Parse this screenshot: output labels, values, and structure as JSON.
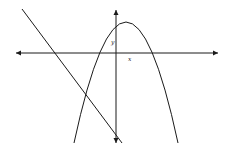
{
  "diagram": {
    "type": "coordinate-graph",
    "axes": {
      "x_label": "x",
      "y_label": "y",
      "x_axis": {
        "from": [
          16,
          53
        ],
        "to": [
          218,
          53
        ],
        "arrows": "both"
      },
      "y_axis": {
        "from": [
          116,
          10
        ],
        "to": [
          116,
          143
        ],
        "arrows": "both"
      }
    },
    "curves": [
      {
        "kind": "parabola",
        "opens": "down",
        "vertex": [
          126,
          22
        ],
        "ends": [
          [
            74,
            143
          ],
          [
            178,
            143
          ]
        ]
      },
      {
        "kind": "line",
        "slope": "negative",
        "from": [
          22,
          9
        ],
        "to": [
          122,
          143
        ]
      }
    ],
    "colors": {
      "stroke": "#1a1a1a",
      "background": "#ffffff"
    }
  }
}
